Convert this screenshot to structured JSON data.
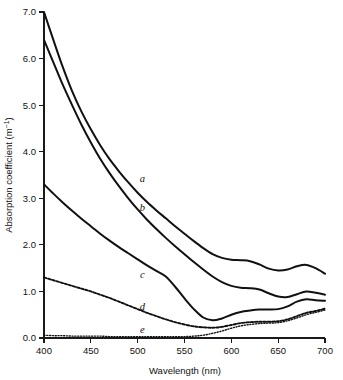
{
  "figure": {
    "background_color": "#ffffff",
    "ink_color": "#111111"
  },
  "axes": {
    "x_title": "Wavelength (nm)",
    "y_title_main": "Absorption coefficient (m",
    "y_title_sup": "−1",
    "y_title_close": ")",
    "y_title_full": "Absorption coefficient (m−1)"
  },
  "chart_data": {
    "type": "line",
    "title": "",
    "subtitle": "",
    "xlabel": "Wavelength (nm)",
    "ylabel": "Absorption coefficient (m−1)",
    "xlim": [
      400,
      700
    ],
    "ylim": [
      0.0,
      7.0
    ],
    "xticks": [
      400,
      450,
      500,
      550,
      600,
      650,
      700
    ],
    "xtick_labels": [
      "400",
      "450",
      "500",
      "550",
      "600",
      "650",
      "700"
    ],
    "yticks": [
      0.0,
      1.0,
      2.0,
      3.0,
      4.0,
      5.0,
      6.0,
      7.0
    ],
    "ytick_labels": [
      "0.0",
      "1.0",
      "2.0",
      "3.0",
      "4.0",
      "5.0",
      "6.0",
      "7.0"
    ],
    "grid": false,
    "legend_position": "inline-curve-labels",
    "x": [
      400,
      410,
      420,
      430,
      440,
      450,
      460,
      470,
      480,
      490,
      500,
      510,
      520,
      530,
      540,
      550,
      560,
      570,
      580,
      590,
      600,
      610,
      620,
      630,
      640,
      650,
      660,
      670,
      680,
      690,
      700
    ],
    "series": [
      {
        "name": "a",
        "label": "a",
        "style": "solid",
        "label_x": 505,
        "label_y": 3.35,
        "values": [
          7.0,
          6.4,
          5.82,
          5.3,
          4.86,
          4.48,
          4.14,
          3.84,
          3.58,
          3.34,
          3.12,
          2.92,
          2.74,
          2.57,
          2.4,
          2.24,
          2.08,
          1.93,
          1.8,
          1.72,
          1.68,
          1.67,
          1.65,
          1.58,
          1.49,
          1.45,
          1.47,
          1.54,
          1.57,
          1.5,
          1.38
        ]
      },
      {
        "name": "b",
        "label": "b",
        "style": "solid",
        "label_x": 505,
        "label_y": 2.72,
        "values": [
          6.4,
          5.92,
          5.44,
          5.0,
          4.58,
          4.2,
          3.85,
          3.54,
          3.26,
          3.0,
          2.76,
          2.54,
          2.34,
          2.15,
          1.97,
          1.8,
          1.63,
          1.47,
          1.32,
          1.2,
          1.12,
          1.08,
          1.07,
          1.04,
          0.96,
          0.89,
          0.88,
          0.94,
          1.0,
          0.97,
          0.93
        ]
      },
      {
        "name": "c",
        "label": "c",
        "style": "solid",
        "label_x": 505,
        "label_y": 1.28,
        "values": [
          3.3,
          3.1,
          2.91,
          2.73,
          2.56,
          2.4,
          2.24,
          2.09,
          1.95,
          1.82,
          1.69,
          1.56,
          1.44,
          1.32,
          1.1,
          0.85,
          0.62,
          0.44,
          0.38,
          0.42,
          0.5,
          0.56,
          0.59,
          0.61,
          0.61,
          0.62,
          0.68,
          0.78,
          0.83,
          0.81,
          0.8
        ]
      },
      {
        "name": "d",
        "label": "d",
        "style": "dashed",
        "label_x": 505,
        "label_y": 0.6,
        "values": [
          1.3,
          1.24,
          1.18,
          1.12,
          1.06,
          1.0,
          0.93,
          0.86,
          0.78,
          0.7,
          0.62,
          0.54,
          0.47,
          0.4,
          0.34,
          0.29,
          0.25,
          0.23,
          0.22,
          0.24,
          0.28,
          0.32,
          0.34,
          0.35,
          0.35,
          0.36,
          0.4,
          0.47,
          0.54,
          0.58,
          0.63
        ]
      },
      {
        "name": "e",
        "label": "e",
        "style": "dotted",
        "label_x": 505,
        "label_y": 0.1,
        "values": [
          0.06,
          0.05,
          0.05,
          0.04,
          0.04,
          0.04,
          0.04,
          0.03,
          0.03,
          0.03,
          0.03,
          0.03,
          0.03,
          0.03,
          0.03,
          0.03,
          0.04,
          0.06,
          0.1,
          0.15,
          0.21,
          0.26,
          0.29,
          0.31,
          0.32,
          0.33,
          0.37,
          0.43,
          0.5,
          0.55,
          0.6
        ]
      }
    ]
  }
}
